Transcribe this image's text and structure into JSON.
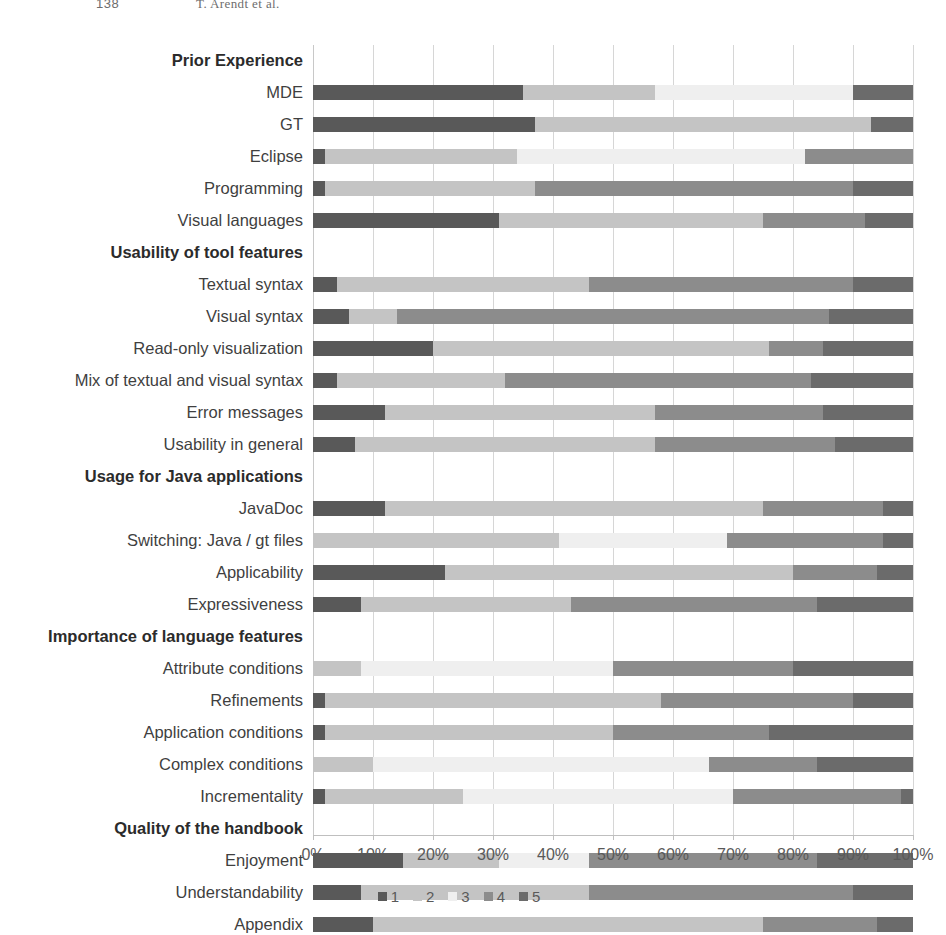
{
  "running_head": {
    "folio": "138",
    "authors": "T. Arendt et al."
  },
  "chart_data": {
    "type": "bar",
    "subtype": "stacked-horizontal-100-percent",
    "title": "",
    "xlabel": "",
    "ylabel": "",
    "xlim": [
      0,
      100
    ],
    "grid": true,
    "legend_position": "bottom-right",
    "x_ticks": [
      "0%",
      "10%",
      "20%",
      "30%",
      "40%",
      "50%",
      "60%",
      "70%",
      "80%",
      "90%",
      "100%"
    ],
    "x_tick_values": [
      0,
      10,
      20,
      30,
      40,
      50,
      60,
      70,
      80,
      90,
      100
    ],
    "legend": [
      {
        "label": "1",
        "color": "#595959"
      },
      {
        "label": "2",
        "color": "#c4c4c4"
      },
      {
        "label": "3",
        "color": "#efefef"
      },
      {
        "label": "4",
        "color": "#8c8c8c"
      },
      {
        "label": "5",
        "color": "#6b6b6b"
      }
    ],
    "series": [
      {
        "name": "1",
        "color": "#595959"
      },
      {
        "name": "2",
        "color": "#c4c4c4"
      },
      {
        "name": "3",
        "color": "#efefef"
      },
      {
        "name": "4",
        "color": "#8c8c8c"
      },
      {
        "name": "5",
        "color": "#6b6b6b"
      }
    ],
    "rows": [
      {
        "label": "Prior Experience",
        "header": true,
        "values": null
      },
      {
        "label": "MDE",
        "header": false,
        "values": [
          35,
          22,
          33,
          0,
          10
        ]
      },
      {
        "label": "GT",
        "header": false,
        "values": [
          37,
          56,
          0,
          0,
          7
        ]
      },
      {
        "label": "Eclipse",
        "header": false,
        "values": [
          2,
          32,
          48,
          18,
          0
        ]
      },
      {
        "label": "Programming",
        "header": false,
        "values": [
          2,
          35,
          0,
          53,
          10
        ]
      },
      {
        "label": "Visual languages",
        "header": false,
        "values": [
          31,
          44,
          0,
          17,
          8
        ]
      },
      {
        "label": "Usability of tool features",
        "header": true,
        "values": null
      },
      {
        "label": "Textual syntax",
        "header": false,
        "values": [
          4,
          42,
          0,
          44,
          10
        ]
      },
      {
        "label": "Visual syntax",
        "header": false,
        "values": [
          6,
          8,
          0,
          72,
          14
        ]
      },
      {
        "label": "Read-only visualization",
        "header": false,
        "values": [
          20,
          56,
          0,
          9,
          15
        ]
      },
      {
        "label": "Mix of textual and visual syntax",
        "header": false,
        "values": [
          4,
          28,
          0,
          51,
          17
        ]
      },
      {
        "label": "Error messages",
        "header": false,
        "values": [
          12,
          45,
          0,
          28,
          15
        ]
      },
      {
        "label": "Usability in general",
        "header": false,
        "values": [
          7,
          50,
          0,
          30,
          13
        ]
      },
      {
        "label": "Usage for Java applications",
        "header": true,
        "values": null
      },
      {
        "label": "JavaDoc",
        "header": false,
        "values": [
          12,
          63,
          0,
          20,
          5
        ]
      },
      {
        "label": "Switching: Java / gt files",
        "header": false,
        "values": [
          0,
          41,
          28,
          26,
          5
        ]
      },
      {
        "label": "Applicability",
        "header": false,
        "values": [
          22,
          58,
          0,
          14,
          6
        ]
      },
      {
        "label": "Expressiveness",
        "header": false,
        "values": [
          8,
          35,
          0,
          41,
          16
        ]
      },
      {
        "label": "Importance of language features",
        "header": true,
        "values": null
      },
      {
        "label": "Attribute conditions",
        "header": false,
        "values": [
          0,
          8,
          42,
          30,
          20
        ]
      },
      {
        "label": "Refinements",
        "header": false,
        "values": [
          2,
          56,
          0,
          32,
          10
        ]
      },
      {
        "label": "Application conditions",
        "header": false,
        "values": [
          2,
          48,
          0,
          26,
          24
        ]
      },
      {
        "label": "Complex conditions",
        "header": false,
        "values": [
          0,
          10,
          56,
          18,
          16
        ]
      },
      {
        "label": "Incrementality",
        "header": false,
        "values": [
          2,
          23,
          45,
          28,
          2
        ]
      },
      {
        "label": "Quality of the handbook",
        "header": true,
        "values": null
      },
      {
        "label": "Enjoyment",
        "header": false,
        "values": [
          15,
          16,
          15,
          38,
          16
        ]
      },
      {
        "label": "Understandability",
        "header": false,
        "values": [
          8,
          38,
          0,
          44,
          10
        ]
      },
      {
        "label": "Appendix",
        "header": false,
        "values": [
          10,
          65,
          0,
          19,
          6
        ]
      }
    ]
  }
}
